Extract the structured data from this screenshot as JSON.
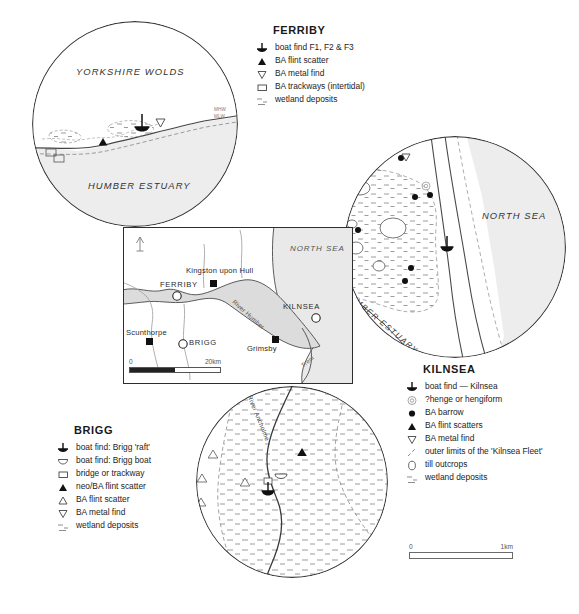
{
  "figure": {
    "caption": ""
  },
  "legends": {
    "ferriby": {
      "title": "FERRIBY",
      "items": [
        {
          "symbol": "boat-find-icon",
          "label": "boat find F1, F2 & F3"
        },
        {
          "symbol": "filled-triangle-icon",
          "label": "BA flint scatter"
        },
        {
          "symbol": "open-inverted-triangle-icon",
          "label": "BA metal find"
        },
        {
          "symbol": "open-square-icon",
          "label": "BA trackways (intertidal)"
        },
        {
          "symbol": "wetland-hatch-icon",
          "label": "wetland deposits"
        }
      ]
    },
    "kilnsea": {
      "title": "KILNSEA",
      "items": [
        {
          "symbol": "boat-find-icon",
          "label": "boat find — Kilnsea"
        },
        {
          "symbol": "henge-icon",
          "label": "?henge or hengiform"
        },
        {
          "symbol": "filled-circle-icon",
          "label": "BA barrow"
        },
        {
          "symbol": "filled-triangle-icon",
          "label": "BA flint scatters"
        },
        {
          "symbol": "open-inverted-triangle-icon",
          "label": "BA metal find"
        },
        {
          "symbol": "dashed-line-icon",
          "label": "outer limits of the 'Kilnsea Fleet'"
        },
        {
          "symbol": "till-outcrop-icon",
          "label": "till outcrops"
        },
        {
          "symbol": "wetland-hatch-icon",
          "label": "wetland deposits"
        }
      ]
    },
    "brigg": {
      "title": "BRIGG",
      "items": [
        {
          "symbol": "boat-find-icon",
          "label": "boat find: Brigg 'raft'"
        },
        {
          "symbol": "logboat-icon",
          "label": "boat find: Brigg boat"
        },
        {
          "symbol": "open-square-icon",
          "label": "bridge or trackway"
        },
        {
          "symbol": "filled-triangle-icon",
          "label": "neo/BA flint scatter"
        },
        {
          "symbol": "open-triangle-icon",
          "label": "BA flint scatter"
        },
        {
          "symbol": "open-inverted-triangle-icon",
          "label": "BA metal find"
        },
        {
          "symbol": "wetland-hatch-icon",
          "label": "wetland deposits"
        }
      ]
    }
  },
  "insets": {
    "ferriby": {
      "name": "ferriby-detail-map",
      "labels": {
        "wolds": "YORKSHIRE WOLDS",
        "estuary": "HUMBER ESTUARY",
        "mhw": "MHW",
        "mlw": "MLW"
      }
    },
    "kilnsea": {
      "name": "kilnsea-detail-map",
      "labels": {
        "north_sea": "NORTH SEA",
        "estuary": "HUMBER ESTUARY"
      }
    },
    "brigg": {
      "name": "brigg-detail-map",
      "labels": {
        "river": "River Ancholme"
      }
    },
    "overview": {
      "name": "humber-overview-map",
      "north_arrow": "N",
      "labels": {
        "north_sea": "NORTH SEA",
        "hull": "Kingston upon Hull",
        "ferriby": "FERRIBY",
        "kilnsea": "KILNSEA",
        "scunthorpe": "Scunthorpe",
        "brigg": "BRIGG",
        "grimsby": "Grimsby",
        "river_humber": "River Humber",
        "trent": "Trent"
      }
    }
  },
  "scalebars": {
    "overview": {
      "left": "0",
      "right": "20km"
    },
    "main": {
      "left": "0",
      "right": "1km"
    }
  },
  "colors": {
    "water_fill": "#ececec",
    "land_fill": "#ffffff",
    "outline": "#3a3a3a",
    "text": "#232323"
  }
}
